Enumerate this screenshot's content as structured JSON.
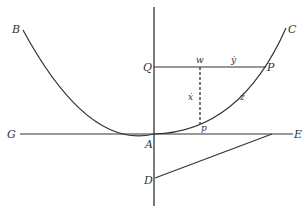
{
  "diagram": {
    "colors": {
      "stroke": "#333333",
      "background": "#ffffff"
    },
    "points": {
      "B": "B",
      "C": "C",
      "Q": "Q",
      "w": "w",
      "P": "P",
      "G": "G",
      "A": "A",
      "p": "p",
      "E": "E",
      "D": "D"
    },
    "segment_labels": {
      "y_dot": "ẏ",
      "x_dot": "ẋ",
      "z_dot": "ż"
    },
    "elements": [
      "curve BAC (parabola-like, vertex at A)",
      "vertical axis through Q, A, D",
      "horizontal line GAE",
      "segment QwP labeled ẏ",
      "dashed segment wp labeled ẋ",
      "arc pP labeled ż",
      "segment DE"
    ]
  }
}
